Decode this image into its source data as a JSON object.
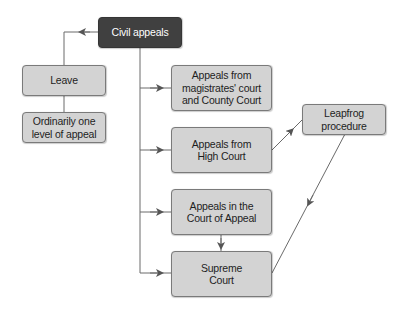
{
  "diagram": {
    "type": "flowchart",
    "colors": {
      "root_fill": "#404040",
      "node_fill": "#d3d3d3",
      "node_border": "#7a7a7a",
      "line": "#6a6a6a"
    },
    "nodes": {
      "civil_appeals": "Civil appeals",
      "leave": "Leave",
      "ordinarily": "Ordinarily one\nlevel of appeal",
      "magistrates": "Appeals from\nmagistrates' court\nand County Court",
      "high_court": "Appeals from\nHigh Court",
      "court_of_appeal": "Appeals in the\nCourt of Appeal",
      "supreme_court": "Supreme\nCourt",
      "leapfrog": "Leapfrog\nprocedure"
    },
    "edges": [
      {
        "from": "civil_appeals",
        "to": "leave"
      },
      {
        "from": "leave",
        "to": "ordinarily"
      },
      {
        "from": "civil_appeals",
        "to": "magistrates"
      },
      {
        "from": "civil_appeals",
        "to": "high_court"
      },
      {
        "from": "civil_appeals",
        "to": "court_of_appeal"
      },
      {
        "from": "civil_appeals",
        "to": "supreme_court"
      },
      {
        "from": "court_of_appeal",
        "to": "supreme_court"
      },
      {
        "from": "high_court",
        "to": "leapfrog"
      },
      {
        "from": "leapfrog",
        "to": "supreme_court"
      }
    ]
  }
}
